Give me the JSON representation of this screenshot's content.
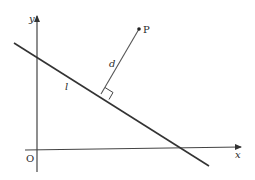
{
  "diagram": {
    "axes": {
      "x_label": "x",
      "y_label": "y",
      "origin_label": "O"
    },
    "line": {
      "label": "l"
    },
    "point": {
      "label": "P"
    },
    "distance": {
      "label": "d"
    },
    "colors": {
      "stroke": "#333333",
      "axis": "#444444",
      "background": "#ffffff"
    }
  }
}
